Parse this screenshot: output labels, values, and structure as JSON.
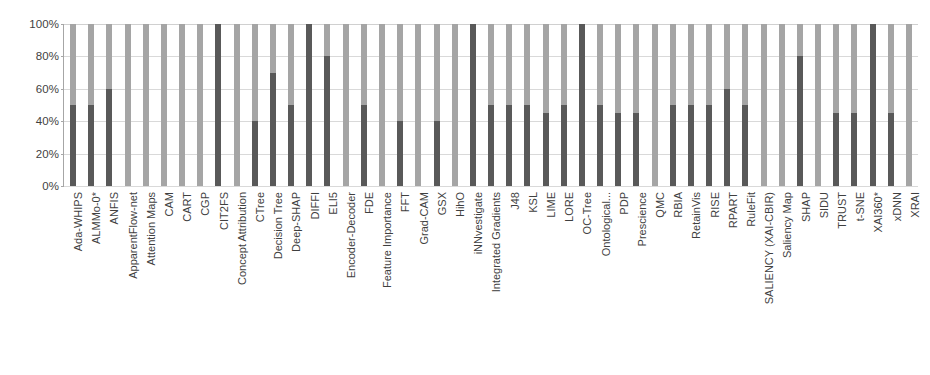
{
  "chart_data": {
    "type": "bar",
    "title": "",
    "subtitle": "",
    "xlabel": "",
    "ylabel": "",
    "stacked": true,
    "stack_mode": "percent",
    "grid": true,
    "legend_position": "none",
    "ylim": [
      0,
      100
    ],
    "ytick_labels": [
      "0%",
      "20%",
      "40%",
      "60%",
      "80%",
      "100%"
    ],
    "ytick_values": [
      0,
      20,
      40,
      60,
      80,
      100
    ],
    "colors": {
      "dark_segment": "#595959",
      "light_segment": "#a5a5a5",
      "gridline": "#d9d9d9",
      "axis": "#a6a6a6",
      "text": "#3f3f3f",
      "background": "#ffffff"
    },
    "categories": [
      "Ada-WHIPS",
      "ALMMo-0*",
      "ANFIS",
      "ApparentFlow-net",
      "Attention Maps",
      "CAM",
      "CART",
      "CGP",
      "CIT2FS",
      "Concept Attribution",
      "CTree",
      "Decision Tree",
      "Deep-SHAP",
      "DIFFI",
      "ELI5",
      "Encoder-Decoder",
      "FDE",
      "Feature Importance",
      "FFT",
      "Grad-CAM",
      "GSX",
      "HihO",
      "iNNvestigate",
      "Integrated Gradients",
      "J48",
      "KSL",
      "LIME",
      "LORE",
      "OC-Tree",
      "Ontological...",
      "PDP",
      "Prescience",
      "QMC",
      "RBIA",
      "RetainVis",
      "RISE",
      "RPART",
      "RuleFit",
      "SALIENCY (XAI-CBIR)",
      "Saliency Map",
      "SHAP",
      "SIDU",
      "TRUST",
      "t-SNE",
      "XAI360*",
      "xDNN",
      "XRAI"
    ],
    "series": [
      {
        "name": "lower-segment",
        "color": "#595959",
        "values": [
          50,
          50,
          60,
          0,
          0,
          0,
          0,
          0,
          100,
          0,
          40,
          70,
          50,
          100,
          80,
          0,
          50,
          0,
          40,
          0,
          40,
          0,
          100,
          50,
          50,
          50,
          45,
          50,
          100,
          50,
          45,
          45,
          0,
          50,
          50,
          50,
          60,
          50,
          0,
          0,
          80,
          0,
          45,
          45,
          100,
          45,
          0
        ]
      },
      {
        "name": "upper-segment",
        "color": "#a5a5a5",
        "values": [
          50,
          50,
          40,
          100,
          100,
          100,
          100,
          100,
          0,
          100,
          60,
          30,
          50,
          0,
          20,
          100,
          50,
          100,
          60,
          100,
          60,
          100,
          0,
          50,
          50,
          50,
          55,
          50,
          0,
          50,
          55,
          55,
          100,
          50,
          50,
          50,
          40,
          50,
          100,
          100,
          20,
          100,
          55,
          55,
          0,
          55,
          100
        ]
      }
    ]
  }
}
